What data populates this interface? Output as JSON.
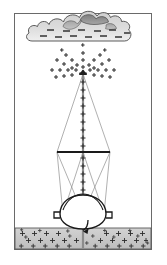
{
  "figure": {
    "title": "Corona discharge from a grounded guyed mast beneath a charged thundercloud",
    "caption": "",
    "width": 167,
    "height": 265,
    "background_color": "#ffffff"
  },
  "frame": {
    "name": "figure-border",
    "x": 14,
    "y": 13,
    "width": 138,
    "height": 237,
    "stroke_color": "#5a5a5a",
    "stroke_width": 1,
    "fill_color": "#ffffff"
  },
  "cloud": {
    "label": "thundercloud",
    "body_fill": "#d9d9d9",
    "top_lobe_fill": "#8f8f8f",
    "mid_lobe_fill": "#b0b0b0",
    "stroke_color": "#4a4a4a",
    "charge_symbol": "-",
    "charge_polarity": "negative",
    "charge_mark_count": 12,
    "charge_mark_color": "#4a4a4a",
    "bounds": {
      "x": 28,
      "y": 14,
      "width": 114,
      "height": 36
    }
  },
  "corona": {
    "label": "corona-discharge-starburst",
    "charge_symbol": "+",
    "charge_polarity": "positive",
    "origin_x": 83,
    "origin_y": 73,
    "ray_count": 12,
    "symbol_color": "#2b2b2b",
    "symbol_size": 5
  },
  "mast": {
    "label": "grounded-mast",
    "tip_x": 83,
    "tip_y": 72,
    "base_y": 248,
    "stroke_color": "#7a7a7a",
    "stroke_width": 2,
    "tip_cap_color": "#1f1f1f",
    "charge_symbol": "+",
    "charge_polarity": "positive",
    "charge_mark_count": 26,
    "charge_mark_color": "#2b2b2b"
  },
  "crossbar": {
    "label": "upper-crossarm",
    "x1": 57,
    "x2": 110,
    "y": 152,
    "stroke_color": "#1f1f1f",
    "stroke_width": 2
  },
  "guys": {
    "label": "guy-wires",
    "stroke_color": "#8a8a8a",
    "stroke_width": 0.8,
    "upper_count": 2,
    "lower_count": 4
  },
  "dome": {
    "label": "base-dome-insulator",
    "center_x": 83,
    "center_y": 220,
    "radius_x": 23,
    "radius_y": 16,
    "fill_color": "#ffffff",
    "stroke_color": "#1f1f1f",
    "stroke_width": 1.4,
    "foot_count": 2
  },
  "ground_arrow": {
    "label": "grounding-current-arrow",
    "direction": "down-into-earth",
    "stroke_color": "#1f1f1f"
  },
  "ground": {
    "label": "earth-soil-layer",
    "top_y": 228,
    "bottom_y": 249,
    "fill_color": "#c6c6c6",
    "stroke_color": "#4a4a4a",
    "charge_symbol": "+",
    "charge_polarity": "positive",
    "charge_mark_color": "#2b2b2b",
    "charge_mark_count": 48
  },
  "legend": {
    "negative_label": "-",
    "positive_label": "+"
  }
}
